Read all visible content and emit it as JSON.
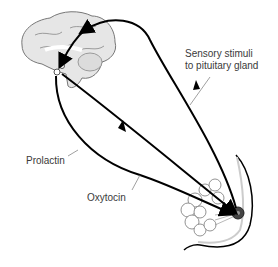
{
  "diagram": {
    "labels": {
      "sensory_line1": "Sensory stimuli",
      "sensory_line2": "to pituitary gland",
      "prolactin": "Prolactin",
      "oxytocin": "Oxytocin"
    },
    "elements": [
      "brain",
      "pituitary-gland",
      "breast",
      "nipple",
      "mammary-glands"
    ],
    "arrows": [
      {
        "from": "nipple",
        "to": "pituitary-gland",
        "label": "Sensory stimuli to pituitary gland"
      },
      {
        "from": "pituitary-gland",
        "to": "mammary-glands",
        "label": "Prolactin"
      },
      {
        "from": "pituitary-gland",
        "to": "nipple",
        "label": "Oxytocin"
      }
    ],
    "colors": {
      "line": "#000000",
      "brain_fill": "#e6e6e6",
      "text": "#3a3a3a"
    }
  }
}
